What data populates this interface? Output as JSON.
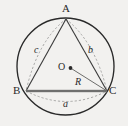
{
  "figure": {
    "background_color": "#f2f1ef",
    "stroke_color": "#2a2a2a",
    "dash_color": "#8a8a8a",
    "chord_color": "#9b9b99"
  },
  "labels": {
    "vertex_a": "A",
    "vertex_b": "B",
    "vertex_c": "C",
    "center_o": "O",
    "radius": "R",
    "side_a": "a",
    "side_b": "b",
    "side_c": "c"
  },
  "geometry": {
    "circle": {
      "cx": 65.5,
      "cy": 66.5,
      "r": 48.5
    },
    "points": {
      "A": {
        "x": 66.0,
        "y": 19.0
      },
      "B": {
        "x": 26.0,
        "y": 91.0
      },
      "C": {
        "x": 107.0,
        "y": 91.0
      },
      "O": {
        "x": 70.5,
        "y": 68.0
      }
    },
    "segments": [
      {
        "name": "side-ab",
        "from": "A",
        "to": "B",
        "style": "solid"
      },
      {
        "name": "side-ac",
        "from": "A",
        "to": "C",
        "style": "solid"
      },
      {
        "name": "side-bc",
        "from": "B",
        "to": "C",
        "style": "solid-thick"
      },
      {
        "name": "radius-oc",
        "from": "O",
        "to": "C",
        "style": "solid"
      },
      {
        "name": "dashed-chord-ab",
        "from": "A",
        "to": "B",
        "style": "dashed-arc"
      },
      {
        "name": "dashed-chord-ac",
        "from": "A",
        "to": "C",
        "style": "dashed-arc"
      },
      {
        "name": "dashed-arc-bc",
        "from": "B",
        "to": "C",
        "style": "dashed-arc"
      }
    ]
  }
}
